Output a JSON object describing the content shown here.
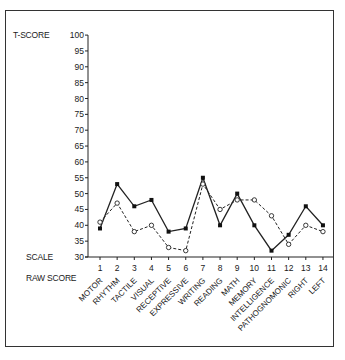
{
  "chart_data": {
    "type": "line",
    "title": "",
    "ylabel": "T-SCORE",
    "xlabel_scale": "SCALE",
    "xlabel_raw": "RAW SCORE",
    "ylim": [
      30,
      100
    ],
    "yticks": [
      30,
      35,
      40,
      45,
      50,
      55,
      60,
      65,
      70,
      75,
      80,
      85,
      90,
      95,
      100
    ],
    "x": [
      1,
      2,
      3,
      4,
      5,
      6,
      7,
      8,
      9,
      10,
      11,
      12,
      13,
      14
    ],
    "categories": [
      "MOTOR",
      "RHYTHM",
      "TACTILE",
      "VISUAL",
      "RECEPTIVE",
      "EXPRESSIVE",
      "WRITING",
      "READING",
      "MATH",
      "MEMORY",
      "INTELLIGENCE",
      "PATHOGNOMONIC",
      "RIGHT",
      "LEFT"
    ],
    "series": [
      {
        "name": "solid",
        "style": "solid",
        "marker": "filled-square",
        "values": [
          39,
          53,
          46,
          48,
          38,
          39,
          55,
          40,
          50,
          40,
          32,
          37,
          46,
          40
        ]
      },
      {
        "name": "dashed",
        "style": "dashed",
        "marker": "open-circle",
        "values": [
          41,
          47,
          38,
          40,
          33,
          32,
          53,
          45,
          48,
          48,
          43,
          34,
          40,
          38
        ]
      }
    ],
    "grid": false,
    "legend": null
  },
  "labels": {
    "t_score": "T-SCORE",
    "scale": "SCALE",
    "raw_score": "RAW SCORE"
  }
}
